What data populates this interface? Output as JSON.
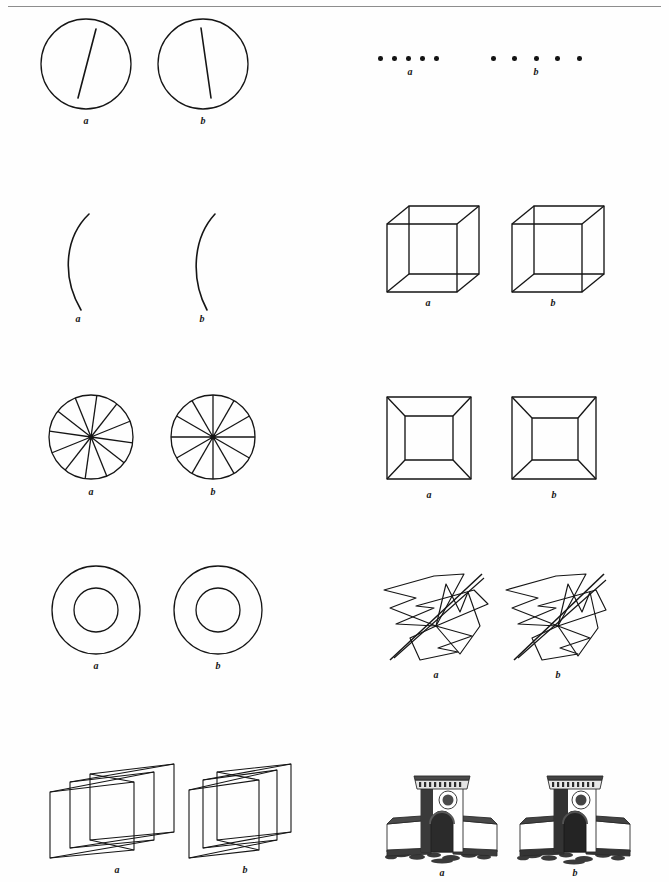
{
  "page": {
    "width": 669,
    "height": 882,
    "background": "#fefefe",
    "ink_color": "#151515",
    "header_rule_color": "#8d8d8d",
    "header_ghost_text": "  ",
    "type": "figure-plate"
  },
  "labels": {
    "a": "a",
    "b": "b"
  },
  "figures": [
    {
      "id": "circle-line",
      "name": "circle-with-tilted-line",
      "row": 1,
      "column": "left",
      "label_a": "a",
      "label_b": "b",
      "geometry": {
        "circle_radius": 45,
        "line_tilt_degrees_a": 12,
        "line_tilt_degrees_b": 7
      }
    },
    {
      "id": "dot-rows",
      "name": "rows-of-dots",
      "row": 1,
      "column": "right",
      "label_a": "a",
      "label_b": "b",
      "geometry": {
        "dot_count": 5,
        "dot_radius": 2.3,
        "spacing_a": 14,
        "spacing_b": 21.5
      }
    },
    {
      "id": "arc",
      "name": "single-curved-arc",
      "row": 2,
      "column": "left",
      "label_a": "a",
      "label_b": "b",
      "geometry": {
        "arc_height": 100,
        "bulge_a": 22,
        "bulge_b": 19
      }
    },
    {
      "id": "necker-cube",
      "name": "necker-cube",
      "row": 2,
      "column": "right",
      "label_a": "a",
      "label_b": "b",
      "geometry": {
        "face_size": 68,
        "depth_offset_x": 22,
        "depth_offset_y": -18
      }
    },
    {
      "id": "spoked-circle",
      "name": "circle-with-twelve-spokes",
      "row": 3,
      "column": "left",
      "label_a": "a",
      "label_b": "b",
      "geometry": {
        "circle_radius": 42,
        "spoke_count": 12,
        "rotation_a": 8,
        "rotation_b": 0
      }
    },
    {
      "id": "truncated-pyramid",
      "name": "truncated-pyramid-corridor",
      "row": 3,
      "column": "right",
      "label_a": "a",
      "label_b": "b",
      "geometry": {
        "outer_size": 84,
        "inner_size": 46
      }
    },
    {
      "id": "annulus",
      "name": "concentric-circles-annulus",
      "row": 4,
      "column": "left",
      "label_a": "a",
      "label_b": "b",
      "geometry": {
        "outer_radius": 44,
        "inner_radius": 22
      }
    },
    {
      "id": "pinwheel",
      "name": "folded-pinwheel-planes",
      "row": 4,
      "column": "right",
      "label_a": "a",
      "label_b": "b",
      "geometry": {
        "blade_count": 4,
        "span": 110
      }
    },
    {
      "id": "folded-sheets",
      "name": "accordion-folded-planes",
      "row": 5,
      "column": "left",
      "label_a": "a",
      "label_b": "b",
      "geometry": {
        "sheet_count": 3,
        "span": 130
      }
    },
    {
      "id": "monument",
      "name": "arched-gateway-monument",
      "row": 5,
      "column": "right",
      "label_a": "a",
      "label_b": "b",
      "geometry": {
        "width": 110,
        "height": 100,
        "features": "central arched tower with cornice and round medallion, flanked by two low walls on rubble ground"
      }
    }
  ]
}
